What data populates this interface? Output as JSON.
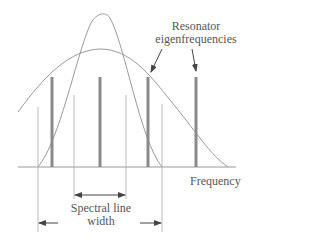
{
  "diagram": {
    "labels": {
      "eigen_line1": "Resonator",
      "eigen_line2": "eigenfrequencies",
      "axis": "Frequency",
      "width_line1": "Spectral line",
      "width_line2": "width"
    },
    "colors": {
      "curve": "#9a9a9a",
      "bar": "#8a8a8a",
      "text": "#555555"
    },
    "bars_x": [
      52,
      100,
      148,
      196
    ]
  }
}
